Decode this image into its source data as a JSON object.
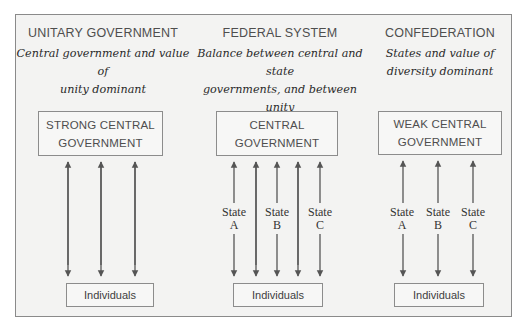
{
  "diagram": {
    "columns": [
      {
        "id": "unitary",
        "heading": "UNITARY GOVERNMENT",
        "description_line1": "Central government and value of",
        "description_line2": "unity dominant",
        "description_line3": "",
        "gov_box_line1": "STRONG CENTRAL",
        "gov_box_line2": "GOVERNMENT",
        "individuals_label": "Individuals",
        "state_labels": []
      },
      {
        "id": "federal",
        "heading": "FEDERAL SYSTEM",
        "description_line1": "Balance between central and state",
        "description_line2": "governments, and between unity",
        "description_line3": "and diversity",
        "gov_box_line1": "CENTRAL",
        "gov_box_line2": "GOVERNMENT",
        "individuals_label": "Individuals",
        "state_labels": [
          {
            "word": "State",
            "letter": "A"
          },
          {
            "word": "State",
            "letter": "B"
          },
          {
            "word": "State",
            "letter": "C"
          }
        ]
      },
      {
        "id": "confederation",
        "heading": "CONFEDERATION",
        "description_line1": "States and value of",
        "description_line2": "diversity dominant",
        "description_line3": "",
        "gov_box_line1": "WEAK CENTRAL",
        "gov_box_line2": "GOVERNMENT",
        "individuals_label": "Individuals",
        "state_labels": [
          {
            "word": "State",
            "letter": "A"
          },
          {
            "word": "State",
            "letter": "B"
          },
          {
            "word": "State",
            "letter": "C"
          }
        ]
      }
    ],
    "colors": {
      "frame_background": "#f3f3f2",
      "border": "#8a8a8a",
      "arrow": "#555555",
      "heading_text": "#4e4e4e",
      "description_text": "#2a2a2a"
    }
  }
}
